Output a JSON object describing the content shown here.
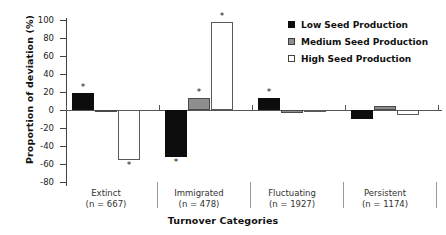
{
  "chart_data": {
    "type": "bar",
    "title": "",
    "xlabel": "Turnover Categories",
    "ylabel": "Proportion of deviation (%)",
    "ylim": [
      -80,
      100
    ],
    "ytick_values": [
      100,
      80,
      60,
      40,
      20,
      0,
      -20,
      -40,
      -60,
      -80
    ],
    "ytick_labels": [
      "100",
      "80",
      "60",
      "40",
      "20",
      "0",
      "-20",
      "-40",
      "-60",
      "-80"
    ],
    "grid": false,
    "legend_position": "upper-right",
    "categories": [
      "Extinct",
      "Immigrated",
      "Fluctuating",
      "Persistent"
    ],
    "category_counts": [
      "(n = 667)",
      "(n = 478)",
      "(n = 1927)",
      "(n = 1174)"
    ],
    "series": [
      {
        "name": "Low Seed Production",
        "color": "#0d0d0d",
        "values": [
          19,
          -52,
          13,
          -10
        ],
        "significant": [
          true,
          true,
          true,
          false
        ]
      },
      {
        "name": "Medium Seed Production",
        "color": "#8e8e8e",
        "values": [
          -2,
          13,
          -3,
          4
        ],
        "significant": [
          false,
          true,
          false,
          false
        ]
      },
      {
        "name": "High Seed Production",
        "color": "#ffffff",
        "values": [
          -55,
          98,
          0,
          -5
        ],
        "significant": [
          true,
          true,
          false,
          false
        ]
      }
    ],
    "significance_marker": "*"
  },
  "legend": {
    "items": [
      {
        "label": "Low Seed Production"
      },
      {
        "label": "Medium Seed Production"
      },
      {
        "label": "High Seed Production"
      }
    ]
  }
}
